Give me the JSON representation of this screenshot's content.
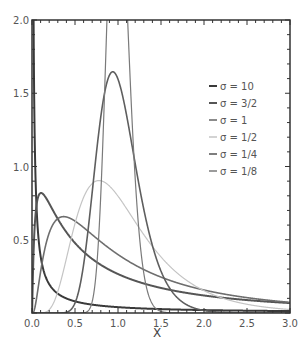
{
  "chart_data": {
    "type": "line",
    "title": "",
    "xlabel": "X",
    "ylabel": "",
    "xlim": [
      0,
      3.0
    ],
    "ylim": [
      0,
      2.0
    ],
    "grid": false,
    "legend_position": "upper right (inside)",
    "x_ticks": [
      "0.0",
      "0.5",
      "1.0",
      "1.5",
      "2.0",
      "2.5",
      "3.0"
    ],
    "y_ticks": [
      "0.5",
      "1.0",
      "1.5",
      "2.0"
    ],
    "distribution": "log-normal, mu = 0",
    "series": [
      {
        "name": "σ = 10",
        "sigma": 10,
        "color": "#3a3a3a",
        "width": 2.0,
        "peak": {
          "x": 0.0,
          "y": "off-scale"
        }
      },
      {
        "name": "σ = 3/2",
        "sigma": 1.5,
        "color": "#555555",
        "width": 2.0,
        "peak": {
          "x": 0.105,
          "y": 0.82
        }
      },
      {
        "name": "σ = 1",
        "sigma": 1.0,
        "color": "#6e6e6e",
        "width": 1.6,
        "peak": {
          "x": 0.37,
          "y": 0.66
        }
      },
      {
        "name": "σ = 1/2",
        "sigma": 0.5,
        "color": "#c4c4c4",
        "width": 1.2,
        "peak": {
          "x": 0.78,
          "y": 0.9
        }
      },
      {
        "name": "σ = 1/4",
        "sigma": 0.25,
        "color": "#5e5e5e",
        "width": 1.6,
        "peak": {
          "x": 0.94,
          "y": 1.65
        }
      },
      {
        "name": "σ = 1/8",
        "sigma": 0.125,
        "color": "#7a7a7a",
        "width": 1.2,
        "peak": {
          "x": 0.98,
          "y": 3.2
        }
      }
    ]
  }
}
